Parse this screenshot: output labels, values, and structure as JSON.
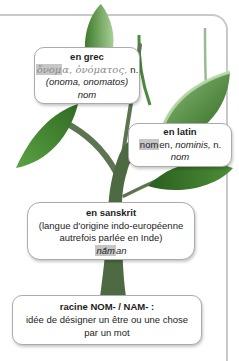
{
  "palette": {
    "card_border": "#c9c9c9",
    "box_border": "#ababab",
    "root_highlight": "#c6c6c6",
    "greek_text": "#8b8b8b",
    "leaf_dark": "#2f6b22",
    "leaf_mid": "#5ba344",
    "leaf_light": "#a8cf96",
    "trunk": "#4e6a43"
  },
  "icons": {
    "tree": "etymology-tree"
  },
  "boxes": {
    "grec": {
      "title": "en grec",
      "greek_root": "ὄνομ",
      "greek_rest": "α, ὀνόματος, ",
      "gender": "n.",
      "translit": "(onoma, onomatos)",
      "translation": "nom"
    },
    "latin": {
      "title": "en latin",
      "root": "nom",
      "word_rest": "en, ",
      "genitive": "nominis, ",
      "gender": "n.",
      "translation": "nom"
    },
    "sanskrit": {
      "title": "en sanskrit",
      "note_line1": "(langue d'origine indo-européenne",
      "note_line2": "autrefois parlée en Inde)",
      "word_root": "nā́m",
      "word_rest": "an"
    },
    "racine": {
      "title": "racine NOM- / NAM- :",
      "definition_line1": "idée de désigner un être ou une chose",
      "definition_line2": "par un mot"
    }
  }
}
